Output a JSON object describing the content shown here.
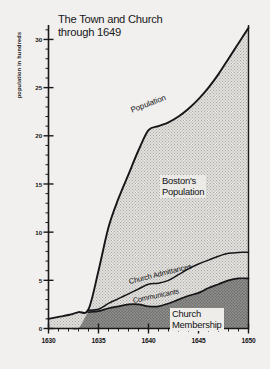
{
  "chart_data": {
    "type": "area",
    "title": "The Town and Church\nthrough 1649",
    "xlabel": "",
    "ylabel": "population in hundreds",
    "xlim": [
      1630,
      1650
    ],
    "ylim": [
      0,
      31.5
    ],
    "grid": false,
    "legend_position": "inline-annotations",
    "x_ticks": [
      1630,
      1635,
      1640,
      1645,
      1650
    ],
    "x_tick_labels": [
      "1630",
      "1635",
      "1640",
      "1645",
      "1650"
    ],
    "y_ticks": [
      0,
      5,
      10,
      15,
      20,
      25,
      30
    ],
    "y_tick_labels": [
      "0",
      "5",
      "10",
      "15",
      "20",
      "25",
      "30"
    ],
    "y_minor_tick_step": 1,
    "x": [
      1630,
      1631,
      1632,
      1633,
      1634,
      1635,
      1636,
      1637,
      1638,
      1639,
      1640,
      1641,
      1642,
      1643,
      1644,
      1645,
      1646,
      1647,
      1648,
      1649,
      1650
    ],
    "series": [
      {
        "name": "Boston's Population",
        "label": "Boston's\nPopulation",
        "curve_label": "Population",
        "fill": "#d8d6d2",
        "pattern": "fine-dot",
        "values": [
          1.0,
          1.2,
          1.4,
          1.7,
          2.0,
          6.0,
          10.5,
          13.5,
          16.0,
          18.5,
          20.6,
          21.0,
          21.4,
          22.0,
          22.8,
          23.8,
          25.0,
          26.4,
          28.0,
          29.6,
          31.2
        ]
      },
      {
        "name": "Church Admittances",
        "label": "Church Admittances",
        "fill": "none",
        "values": [
          0.0,
          0.0,
          0.0,
          0.0,
          1.9,
          2.0,
          2.6,
          3.1,
          3.6,
          4.1,
          4.6,
          4.7,
          5.0,
          5.6,
          6.2,
          6.7,
          7.1,
          7.5,
          7.8,
          7.9,
          7.9
        ]
      },
      {
        "name": "Church Membership",
        "label": "Church\nMembership",
        "curve_label": "Communicants",
        "fill": "#8a8a88",
        "pattern": "coarse-dot",
        "values": [
          0.0,
          0.0,
          0.0,
          0.0,
          1.7,
          1.8,
          2.1,
          2.3,
          2.5,
          2.5,
          2.3,
          2.3,
          2.6,
          3.0,
          3.4,
          3.7,
          4.2,
          4.6,
          5.0,
          5.2,
          5.2
        ]
      }
    ]
  },
  "annotations": {
    "population_curve": "Population",
    "boston_population": "Boston's\nPopulation",
    "church_admittances": "Church Admittances",
    "communicants": "Communicants",
    "church_membership": "Church\nMembership"
  },
  "colors": {
    "background": "#f2f0ee",
    "axis": "#18181b",
    "population_fill": "#d9d7d3",
    "membership_fill": "#8b8b89",
    "text": "#17171a"
  }
}
